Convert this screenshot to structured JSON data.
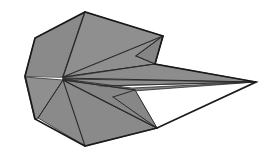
{
  "figure": {
    "canvas": {
      "width": 272,
      "height": 168
    },
    "palette": {
      "background": "#ffffff",
      "facet_fill": "#8a8a8a",
      "facet_fill_light": "#8f8f8f",
      "facet_fill_dark": "#7f7f7f",
      "outline": "#1a1a1a",
      "crease": "#2b2b2b"
    },
    "stroke_widths": {
      "outline": 1.6,
      "crease": 1.1,
      "thin_crease": 0.8
    },
    "key_points": {
      "nose_hub": [
        63,
        77
      ],
      "left_tip": [
        25,
        76
      ],
      "top_apex": [
        85,
        12
      ],
      "top_right_corner": [
        163,
        36
      ],
      "upper_fold_vertex": [
        155,
        64
      ],
      "tail_tip": [
        256,
        82
      ],
      "lower_fold_vertex": [
        157,
        128
      ],
      "bottom_apex": [
        85,
        146
      ],
      "bottom_left_corner": [
        35,
        119
      ],
      "top_left_corner": [
        35,
        38
      ]
    },
    "facets": [
      {
        "name": "upper-left-wing-panel",
        "fill": "#8a8a8a",
        "points": "25,76 35,38 85,12 89,14 63,77"
      },
      {
        "name": "upper-mid-wing-panel",
        "fill": "#8f8f8f",
        "points": "85,12 163,36 155,64 63,77"
      },
      {
        "name": "upper-right-wing-flap",
        "fill": "#858585",
        "points": "163,36 155,64 136,56"
      },
      {
        "name": "upper-tail-blade",
        "fill": "#8d8d8d",
        "points": "155,64 256,82 100,86 63,78"
      },
      {
        "name": "lower-tail-blade",
        "fill": "#828282",
        "points": "63,79 132,88 256,82 120,92"
      },
      {
        "name": "lower-mid-wing-panel",
        "fill": "#8a8a8a",
        "points": "63,80 157,128 85,146 38,118"
      },
      {
        "name": "lower-left-wing-panel",
        "fill": "#8f8f8f",
        "points": "25,77 63,80 38,118 35,119"
      },
      {
        "name": "lower-right-wing-flap",
        "fill": "#848484",
        "points": "157,128 135,90 113,97"
      },
      {
        "name": "lower-right-inner-panel",
        "fill": "#878787",
        "points": "63,80 135,90 157,128"
      }
    ],
    "creases": [
      {
        "name": "crease-nose-to-top-apex",
        "d": "M63,77 L85,12",
        "width": 1.1
      },
      {
        "name": "crease-nose-to-top-right",
        "d": "M63,77 L163,36",
        "width": 1.1
      },
      {
        "name": "crease-nose-to-upper-fold",
        "d": "M63,77 L155,64",
        "width": 1.2
      },
      {
        "name": "crease-nose-to-tail-upper",
        "d": "M63,78 L256,82",
        "width": 1.0
      },
      {
        "name": "crease-nose-to-tail-lower",
        "d": "M63,79 L252,82",
        "width": 0.8
      },
      {
        "name": "crease-nose-to-lower-inner",
        "d": "M63,80 L135,90",
        "width": 1.0
      },
      {
        "name": "crease-nose-to-lower-fold",
        "d": "M63,80 L157,128",
        "width": 1.2
      },
      {
        "name": "crease-nose-to-bottom-apex",
        "d": "M63,80 L85,146",
        "width": 1.1
      },
      {
        "name": "crease-nose-to-bottom-left",
        "d": "M63,80 L38,118",
        "width": 1.0
      },
      {
        "name": "crease-upper-flap-inner",
        "d": "M136,56 L163,36",
        "width": 1.0
      },
      {
        "name": "crease-upper-flap-outer",
        "d": "M136,56 L155,64",
        "width": 1.0
      },
      {
        "name": "crease-lower-flap-inner",
        "d": "M113,97 L135,90",
        "width": 1.0
      },
      {
        "name": "crease-lower-flap-outer",
        "d": "M113,97 L157,128",
        "width": 1.0
      },
      {
        "name": "crease-tail-spine",
        "d": "M100,86 L256,82",
        "width": 0.8
      }
    ],
    "outlines": [
      {
        "name": "outline-upper-body",
        "d": "M25,76 L35,38 L85,12 L163,36 L155,64 L256,82 L157,128 L85,146 L35,119 Z",
        "width": 1.7
      }
    ]
  }
}
